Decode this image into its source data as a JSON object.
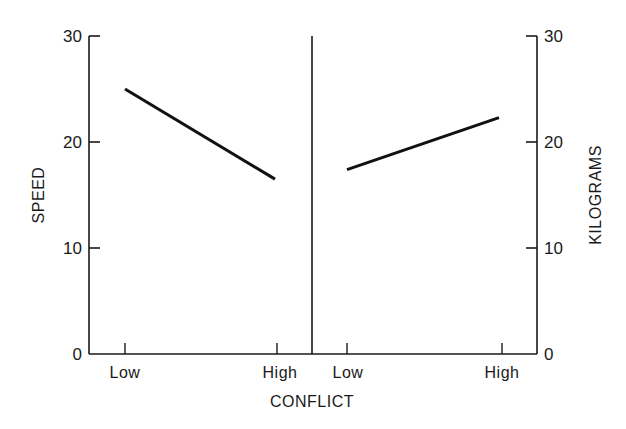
{
  "chart_data": [
    {
      "type": "line",
      "panel": "left",
      "title": "",
      "xlabel": "CONFLICT",
      "ylabel": "SPEED",
      "categories": [
        "Low",
        "High"
      ],
      "series": [
        {
          "name": "Speed",
          "values": [
            25,
            16.5
          ]
        }
      ],
      "ylim": [
        0,
        30
      ],
      "yticks": [
        0,
        10,
        20,
        30
      ],
      "grid": false,
      "legend": null
    },
    {
      "type": "line",
      "panel": "right",
      "title": "",
      "xlabel": "CONFLICT",
      "ylabel": "KILOGRAMS",
      "categories": [
        "Low",
        "High"
      ],
      "series": [
        {
          "name": "Kilograms",
          "values": [
            17.4,
            22.3
          ]
        }
      ],
      "ylim": [
        0,
        30
      ],
      "yticks": [
        0,
        10,
        20,
        30
      ],
      "grid": false,
      "legend": null
    }
  ],
  "labels": {
    "left_ylabel": "SPEED",
    "right_ylabel": "KILOGRAMS",
    "xlabel": "CONFLICT",
    "left_ticks": [
      "0",
      "10",
      "20",
      "30"
    ],
    "right_ticks": [
      "0",
      "10",
      "20",
      "30"
    ],
    "left_categories": [
      "Low",
      "High"
    ],
    "right_categories": [
      "Low",
      "High"
    ]
  },
  "colors": {
    "ink": "#1a1a1a",
    "background": "#ffffff"
  }
}
